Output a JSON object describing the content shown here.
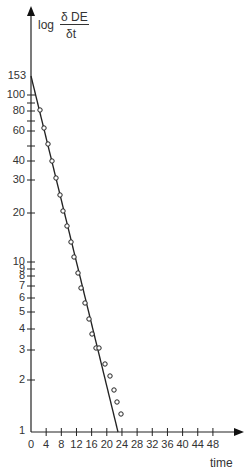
{
  "chart_data": {
    "type": "scatter",
    "title": "",
    "ylabel": "log δDE/δt",
    "ylabel_parts": {
      "prefix": "log",
      "numerator": "δ DE",
      "denominator": "δt"
    },
    "xlabel": "time",
    "yscale": "log",
    "ylim": [
      1,
      153
    ],
    "xlim": [
      0,
      48
    ],
    "y_ticks": [
      "153",
      "100",
      "80",
      "60",
      "40",
      "30",
      "20",
      "10",
      "9",
      "8",
      "7",
      "6",
      "5",
      "4",
      "3",
      "2",
      "1"
    ],
    "x_ticks": [
      "0",
      "4",
      "8",
      "12",
      "16",
      "20",
      "24",
      "28",
      "32",
      "36",
      "40",
      "44",
      "48"
    ],
    "grid": false,
    "legend": null,
    "series": [
      {
        "name": "observed points",
        "style": "open circles",
        "x": [
          2.4,
          3.5,
          4.5,
          5.5,
          6.6,
          7.6,
          8.5,
          9.5,
          10.5,
          11.3,
          12.4,
          13.2,
          14.2,
          15.3,
          16.1,
          17.2,
          18.2,
          19.2,
          20.8,
          21.9,
          22.7,
          23.7,
          24.8
        ],
        "y": [
          83,
          65,
          51,
          40,
          32,
          25,
          20,
          16.5,
          13,
          10.5,
          8.5,
          7,
          5.8,
          4.7,
          3.9,
          3.2,
          2.5,
          2.1,
          1.75,
          1.5,
          1.3,
          1.15,
          1.0
        ]
      },
      {
        "name": "fitted line",
        "style": "solid line",
        "x": [
          0,
          23.5
        ],
        "y": [
          153,
          1
        ]
      }
    ]
  }
}
